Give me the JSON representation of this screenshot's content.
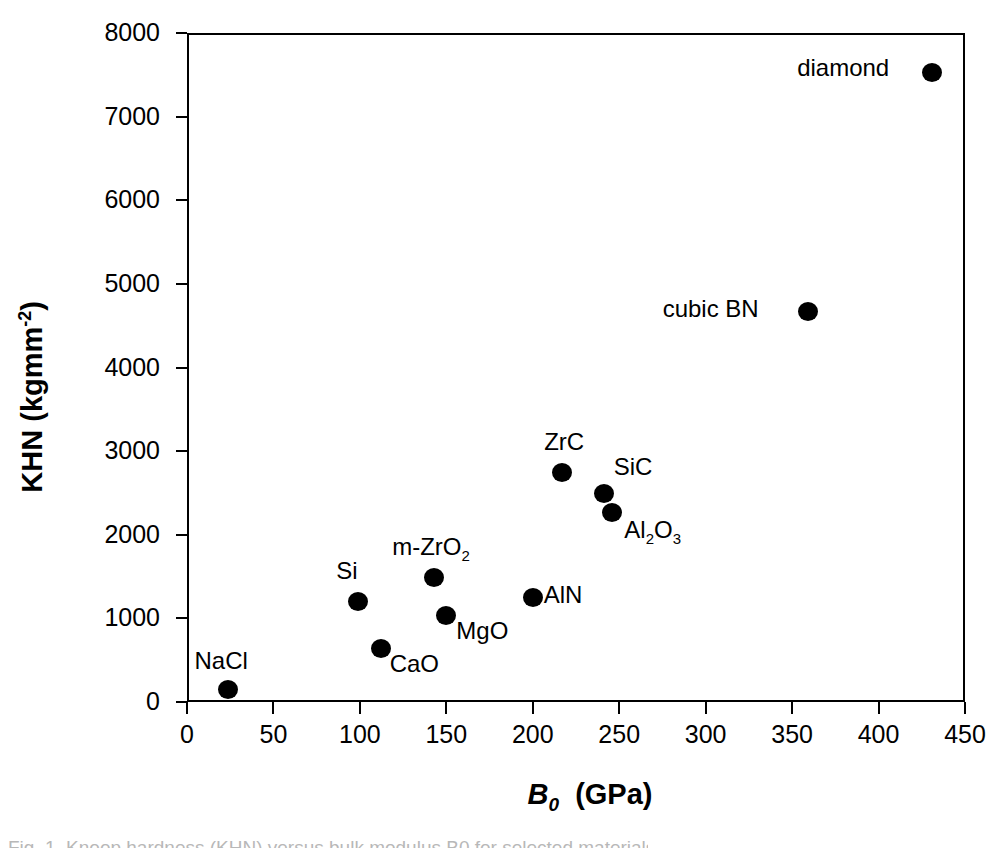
{
  "chart_data": {
    "type": "scatter",
    "title": "",
    "xlabel": "B0 (GPa)",
    "ylabel": "KHN (kgmm-2)",
    "xlim": [
      0,
      450
    ],
    "ylim": [
      0,
      8000
    ],
    "xticks": [
      0,
      50,
      100,
      150,
      200,
      250,
      300,
      350,
      400,
      450
    ],
    "yticks": [
      0,
      1000,
      2000,
      3000,
      4000,
      5000,
      6000,
      7000,
      8000
    ],
    "grid": false,
    "legend": "none",
    "marker": "filled-circle",
    "marker_color": "#000000",
    "points": [
      {
        "label": "NaCl",
        "x": 24,
        "y": 155,
        "label_dx": -34,
        "label_dy": -42
      },
      {
        "label": "CaO",
        "x": 112,
        "y": 645,
        "label_dx": 9,
        "label_dy": 2
      },
      {
        "label": "Si",
        "x": 99,
        "y": 1205,
        "label_dx": -22,
        "label_dy": -44
      },
      {
        "label": "MgO",
        "x": 150,
        "y": 1040,
        "label_dx": 10,
        "label_dy": 2
      },
      {
        "label": "m-ZrO2",
        "x": 143,
        "y": 1495,
        "label_dx": -42,
        "label_dy": -44
      },
      {
        "label": "AlN",
        "x": 200,
        "y": 1255,
        "label_dx": 11,
        "label_dy": -16
      },
      {
        "label": "ZrC",
        "x": 217,
        "y": 2750,
        "label_dx": -18,
        "label_dy": -44
      },
      {
        "label": "SiC",
        "x": 241,
        "y": 2500,
        "label_dx": 10,
        "label_dy": -40
      },
      {
        "label": "Al2O3",
        "x": 246,
        "y": 2270,
        "label_dx": 12,
        "label_dy": 4
      },
      {
        "label": "cubic BN",
        "x": 359,
        "y": 4675,
        "label_dx": -145,
        "label_dy": -16
      },
      {
        "label": "diamond",
        "x": 431,
        "y": 7535,
        "label_dx": -135,
        "label_dy": -18
      }
    ]
  },
  "axes": {
    "y_title_main": "KHN  (kgmm",
    "y_title_sup": "-2",
    "y_title_close": ")",
    "x_title_symbol": "B",
    "x_title_sub": "0",
    "x_title_units": "(GPa)",
    "ytick_labels": [
      "0",
      "1000",
      "2000",
      "3000",
      "4000",
      "5000",
      "6000",
      "7000",
      "8000"
    ],
    "xtick_labels": [
      "0",
      "50",
      "100",
      "150",
      "200",
      "250",
      "300",
      "350",
      "400",
      "450"
    ]
  },
  "point_labels": {
    "nacl": "NaCl",
    "cao": "CaO",
    "si": "Si",
    "mgo": "MgO",
    "mzro2_prefix": "m-ZrO",
    "mzro2_sub": "2",
    "aln": "AlN",
    "zrc": "ZrC",
    "sic": "SiC",
    "al2o3_a": "Al",
    "al2o3_sub1": "2",
    "al2o3_o": "O",
    "al2o3_sub2": "3",
    "cubic_bn": "cubic BN",
    "diamond": "diamond"
  },
  "artifact": {
    "text": "Fig. 1. Knoop hardness (KHN) versus bulk modulus B0 for selected materials."
  }
}
